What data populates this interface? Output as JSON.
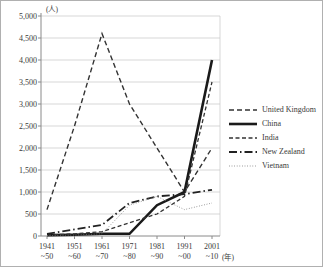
{
  "figure_title": "",
  "chart_data": {
    "type": "line",
    "title": "",
    "xlabel": "",
    "ylabel": "",
    "unit_y": "(人)",
    "unit_x": "(年)",
    "ylim": [
      0,
      5000
    ],
    "ytick_step": 500,
    "ytick_labels": [
      "0",
      "500",
      "1,000",
      "1,500",
      "2,000",
      "2,500",
      "3,000",
      "3,500",
      "4,000",
      "4,500",
      "5,000"
    ],
    "categories_line1": [
      "1941",
      "1951",
      "1961",
      "1971",
      "1981",
      "1991",
      "2001"
    ],
    "categories_line2": [
      "~50",
      "~60",
      "~70",
      "~80",
      "~90",
      "~00",
      "~10"
    ],
    "grid": true,
    "legend_position": "right",
    "series": [
      {
        "name": "United Kingdom",
        "style": "dashed",
        "color": "#333333",
        "width": 1.4,
        "dash": "5,3",
        "values": [
          600,
          2500,
          4600,
          3000,
          2000,
          1000,
          2000
        ]
      },
      {
        "name": "China",
        "style": "solid",
        "color": "#1a1a1a",
        "width": 2.6,
        "dash": "",
        "values": [
          20,
          30,
          50,
          50,
          700,
          1000,
          4000
        ]
      },
      {
        "name": "India",
        "style": "dashed",
        "color": "#333333",
        "width": 1.3,
        "dash": "4,2.5",
        "values": [
          20,
          50,
          100,
          300,
          500,
          900,
          3500
        ]
      },
      {
        "name": "New Zealand",
        "style": "dash-dot",
        "color": "#222222",
        "width": 1.8,
        "dash": "8,3,1.5,3",
        "values": [
          50,
          150,
          250,
          750,
          900,
          950,
          1050
        ]
      },
      {
        "name": "Vietnam",
        "style": "dotted",
        "color": "#777777",
        "width": 0.9,
        "dash": "0.8,1.8",
        "values": [
          10,
          20,
          50,
          700,
          900,
          600,
          750
        ]
      }
    ]
  },
  "colors": {
    "background": "#ffffff",
    "grid": "#c9c9c9",
    "axis": "#8a8a8a",
    "text": "#3a3a3a",
    "frame": "#b0b0b0"
  }
}
